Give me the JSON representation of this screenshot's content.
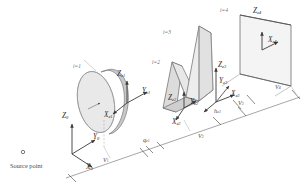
{
  "figure": {
    "kind": "optical-system-3d-diagram",
    "source": {
      "marker_label": "o",
      "caption": "Source point"
    },
    "colors": {
      "line": "#4a4a4a",
      "fill_light": "#efefef",
      "fill_mid": "#e2e2e2",
      "fill_dark": "#d4d4d4",
      "edge": "#8d8d8d",
      "text": "#3a3a3a",
      "background": "#ffffff"
    },
    "global_axes": {
      "name": "global-frame",
      "x": "X",
      "x_sub": "0",
      "y": "Y",
      "y_sub": "0",
      "z": "Z",
      "z_sub": "0"
    },
    "elements": [
      {
        "id": "i1",
        "index_label": "i=1",
        "shape": "elliptical-lens-disk",
        "axes": {
          "x": "X",
          "x_sub": "e1",
          "y": "Y",
          "y_sub": "e1",
          "z": "Z",
          "z_sub": "e1"
        }
      },
      {
        "id": "i2",
        "index_label": "i=2",
        "shape": "wedge-prism",
        "axes": {
          "x": "X",
          "x_sub": "e2",
          "y": "Y",
          "y_sub": "e2",
          "z": "Z",
          "z_sub": "e2"
        }
      },
      {
        "id": "i3",
        "index_label": "i=3",
        "shape": "tall-prism",
        "axes": {
          "x": "X",
          "x_sub": "e3",
          "y": "Y",
          "y_sub": "e3",
          "z": "Z",
          "z_sub": "e3"
        }
      },
      {
        "id": "i4",
        "index_label": "i=4",
        "shape": "image-plane-screen",
        "axes": {
          "x": "X",
          "x_sub": "e4",
          "z": "Z",
          "z_sub": "e4"
        }
      }
    ],
    "dimensions": [
      {
        "name": "v1",
        "text": "V",
        "sub": "1"
      },
      {
        "name": "v2",
        "text": "V",
        "sub": "2"
      },
      {
        "name": "v3",
        "text": "V",
        "sub": "3"
      },
      {
        "name": "v4",
        "text": "V",
        "sub": "4"
      },
      {
        "name": "qe1",
        "text": "q",
        "sub": "e1"
      },
      {
        "name": "he3",
        "text": "h",
        "sub": "e3"
      }
    ]
  }
}
